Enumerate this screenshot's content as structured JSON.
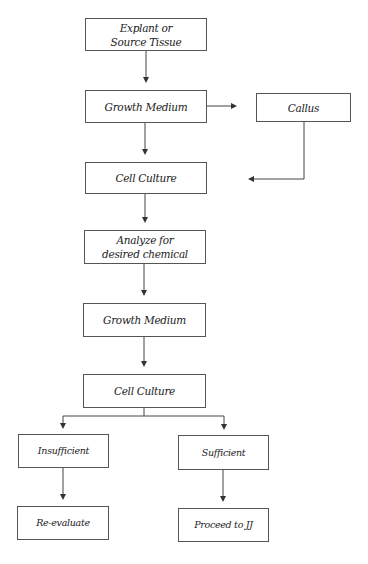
{
  "diagram": {
    "type": "flowchart",
    "nodes": [
      {
        "id": "explant",
        "label": "Explant or\nSource Tissue",
        "line1": "Explant or",
        "line2": "Source Tissue"
      },
      {
        "id": "growth1",
        "label": "Growth Medium"
      },
      {
        "id": "callus",
        "label": "Callus"
      },
      {
        "id": "culture1",
        "label": "Cell Culture"
      },
      {
        "id": "analyze",
        "label": "Analyze for\ndesired chemical",
        "line1": "Analyze for",
        "line2": "desired chemical"
      },
      {
        "id": "growth2",
        "label": "Growth Medium"
      },
      {
        "id": "culture2",
        "label": "Cell Culture"
      },
      {
        "id": "insufficient",
        "label": "Insufficient"
      },
      {
        "id": "sufficient",
        "label": "Sufficient"
      },
      {
        "id": "reevaluate",
        "label": "Re-evaluate"
      },
      {
        "id": "proceed",
        "label": "Proceed to JJ"
      }
    ],
    "edges": [
      {
        "from": "explant",
        "to": "growth1"
      },
      {
        "from": "growth1",
        "to": "callus"
      },
      {
        "from": "growth1",
        "to": "culture1"
      },
      {
        "from": "callus",
        "to": "culture1"
      },
      {
        "from": "culture1",
        "to": "analyze"
      },
      {
        "from": "analyze",
        "to": "growth2"
      },
      {
        "from": "growth2",
        "to": "culture2"
      },
      {
        "from": "culture2",
        "to": "insufficient"
      },
      {
        "from": "culture2",
        "to": "sufficient"
      },
      {
        "from": "insufficient",
        "to": "reevaluate"
      },
      {
        "from": "sufficient",
        "to": "proceed"
      }
    ]
  }
}
